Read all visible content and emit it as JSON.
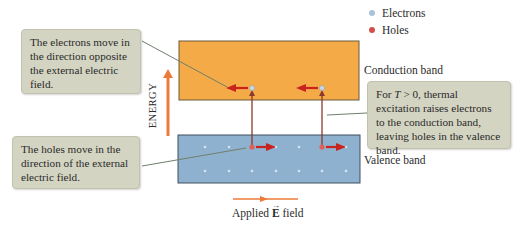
{
  "legend": {
    "items": [
      {
        "label": "Electrons",
        "color": "#a9c3dc"
      },
      {
        "label": "Holes",
        "color": "#d2504a"
      }
    ]
  },
  "bands": {
    "conduction": {
      "label": "Conduction band",
      "color": "#f5aa48"
    },
    "valence": {
      "label": "Valence band",
      "color": "#8fb1d0"
    }
  },
  "axis": {
    "energy_label": "ENERGY",
    "arrow_color": "#ee7a3a"
  },
  "callouts": {
    "electrons_move": "The electrons move in the direction opposite the external electric field.",
    "holes_move": "The holes move in the direction of the external electric field.",
    "thermal": {
      "prefix": "For ",
      "var": "T",
      "condition": " > 0, thermal excitation raises electrons to the conduction band, leaving holes in the valence band."
    }
  },
  "field": {
    "label_prefix": "Applied ",
    "symbol": "E",
    "label_suffix": " field",
    "arrow_color": "#ee7a3a"
  }
}
